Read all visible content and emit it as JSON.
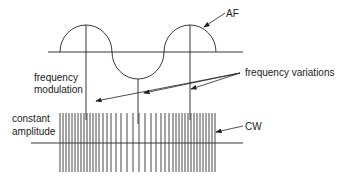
{
  "diagram": {
    "labels": {
      "af": "AF",
      "frequency_modulation_line1": "frequency",
      "frequency_modulation_line2": "modulation",
      "frequency_variations": "frequency variations",
      "constant_amplitude_line1": "constant",
      "constant_amplitude_line2": "amplitude",
      "cw": "CW"
    },
    "colors": {
      "stroke": "#222222",
      "background": "#ffffff"
    }
  }
}
